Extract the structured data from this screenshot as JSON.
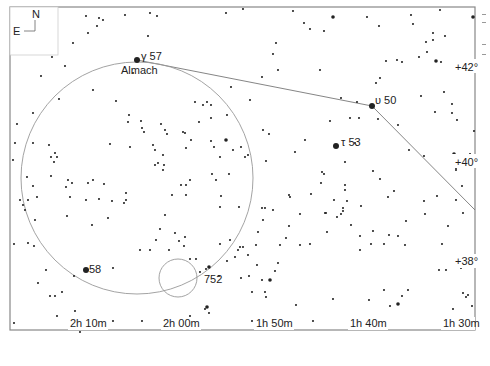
{
  "compass": {
    "north": "N",
    "east": "E"
  },
  "labels": {
    "almach_greek": "γ 57",
    "almach_name": "Almach",
    "upsilon": "υ 50",
    "tau": "τ 53",
    "star58": "58",
    "ngc752": "752"
  },
  "dec_labels": [
    "+42°",
    "+40°",
    "+38°"
  ],
  "ra_labels": [
    "2h 10m",
    "2h 00m",
    "1h 50m",
    "1h 40m",
    "1h 30m"
  ],
  "credit": "Megastar",
  "colors": {
    "frame": "#888888",
    "line": "#777777",
    "star": "#222222",
    "bg": "#ffffff"
  },
  "stars": [
    [
      86,
      16,
      1
    ],
    [
      99,
      18,
      1
    ],
    [
      103,
      20,
      1
    ],
    [
      125,
      15,
      1
    ],
    [
      97,
      26,
      1
    ],
    [
      88,
      33,
      1
    ],
    [
      73,
      43,
      1
    ],
    [
      150,
      13,
      1
    ],
    [
      137,
      60,
      3
    ],
    [
      148,
      36,
      1
    ],
    [
      133,
      73,
      1
    ],
    [
      65,
      66,
      1
    ],
    [
      41,
      76,
      1
    ],
    [
      93,
      90,
      1
    ],
    [
      116,
      101,
      1
    ],
    [
      33,
      113,
      1
    ],
    [
      59,
      99,
      1
    ],
    [
      157,
      16,
      1
    ],
    [
      226,
      13,
      1
    ],
    [
      243,
      9,
      1
    ],
    [
      293,
      11,
      1
    ],
    [
      304,
      23,
      1
    ],
    [
      310,
      29,
      1
    ],
    [
      333,
      17,
      2
    ],
    [
      324,
      31,
      1
    ],
    [
      276,
      43,
      1
    ],
    [
      278,
      70,
      1
    ],
    [
      273,
      54,
      1
    ],
    [
      320,
      70,
      1
    ],
    [
      262,
      77,
      1
    ],
    [
      231,
      87,
      1
    ],
    [
      250,
      100,
      1
    ],
    [
      367,
      17,
      1
    ],
    [
      411,
      15,
      1
    ],
    [
      413,
      24,
      1
    ],
    [
      379,
      26,
      1
    ],
    [
      440,
      10,
      1
    ],
    [
      473,
      17,
      2
    ],
    [
      433,
      33,
      1
    ],
    [
      445,
      36,
      1
    ],
    [
      454,
      61,
      1
    ],
    [
      441,
      62,
      1
    ],
    [
      419,
      57,
      1
    ],
    [
      436,
      61,
      2
    ],
    [
      380,
      78,
      1
    ],
    [
      376,
      83,
      1
    ],
    [
      386,
      61,
      1
    ],
    [
      397,
      60,
      1
    ],
    [
      402,
      62,
      1
    ],
    [
      427,
      52,
      1
    ],
    [
      426,
      42,
      1
    ],
    [
      433,
      40,
      1
    ],
    [
      341,
      98,
      1
    ],
    [
      357,
      102,
      1
    ],
    [
      372,
      106,
      3
    ],
    [
      350,
      118,
      1
    ],
    [
      359,
      118,
      1
    ],
    [
      378,
      119,
      1
    ],
    [
      398,
      125,
      1
    ],
    [
      452,
      113,
      1
    ],
    [
      452,
      104,
      1
    ],
    [
      336,
      146,
      3
    ],
    [
      355,
      143,
      1
    ],
    [
      457,
      120,
      1
    ],
    [
      474,
      131,
      1
    ],
    [
      454,
      154,
      2
    ],
    [
      470,
      154,
      1
    ],
    [
      462,
      186,
      1
    ],
    [
      345,
      162,
      1
    ],
    [
      373,
      171,
      1
    ],
    [
      380,
      179,
      1
    ],
    [
      394,
      191,
      1
    ],
    [
      424,
      156,
      1
    ],
    [
      424,
      201,
      1
    ],
    [
      437,
      196,
      1
    ],
    [
      456,
      200,
      1
    ],
    [
      425,
      214,
      1
    ],
    [
      345,
      190,
      1
    ],
    [
      334,
      200,
      1
    ],
    [
      325,
      213,
      1
    ],
    [
      361,
      206,
      1
    ],
    [
      388,
      197,
      1
    ],
    [
      343,
      208,
      1
    ],
    [
      347,
      201,
      1
    ],
    [
      343,
      211,
      1
    ],
    [
      337,
      217,
      1
    ],
    [
      327,
      232,
      1
    ],
    [
      360,
      236,
      1
    ],
    [
      360,
      250,
      1
    ],
    [
      371,
      244,
      1
    ],
    [
      373,
      231,
      1
    ],
    [
      384,
      244,
      1
    ],
    [
      389,
      235,
      1
    ],
    [
      398,
      236,
      1
    ],
    [
      406,
      221,
      1
    ],
    [
      405,
      245,
      1
    ],
    [
      448,
      226,
      1
    ],
    [
      442,
      244,
      1
    ],
    [
      446,
      270,
      1
    ],
    [
      439,
      270,
      1
    ],
    [
      466,
      297,
      1
    ],
    [
      468,
      295,
      1
    ],
    [
      453,
      309,
      1
    ],
    [
      472,
      306,
      1
    ],
    [
      463,
      293,
      1
    ],
    [
      333,
      299,
      1
    ],
    [
      369,
      300,
      1
    ],
    [
      384,
      290,
      1
    ],
    [
      390,
      306,
      1
    ],
    [
      398,
      304,
      2
    ],
    [
      402,
      296,
      1
    ],
    [
      408,
      290,
      1
    ],
    [
      296,
      305,
      1
    ],
    [
      313,
      321,
      1
    ],
    [
      266,
      297,
      1
    ],
    [
      287,
      328,
      1
    ],
    [
      252,
      321,
      1
    ],
    [
      252,
      292,
      1
    ],
    [
      270,
      280,
      2
    ],
    [
      262,
      280,
      1
    ],
    [
      275,
      271,
      1
    ],
    [
      257,
      265,
      1
    ],
    [
      235,
      257,
      1
    ],
    [
      241,
      278,
      1
    ],
    [
      249,
      276,
      1
    ],
    [
      243,
      247,
      1
    ],
    [
      219,
      276,
      1
    ],
    [
      227,
      261,
      1
    ],
    [
      238,
      250,
      1
    ],
    [
      278,
      263,
      1
    ],
    [
      258,
      232,
      1
    ],
    [
      280,
      245,
      1
    ],
    [
      286,
      238,
      1
    ],
    [
      265,
      208,
      1
    ],
    [
      273,
      210,
      1
    ],
    [
      289,
      226,
      1
    ],
    [
      300,
      214,
      1
    ],
    [
      311,
      194,
      1
    ],
    [
      289,
      195,
      1
    ],
    [
      290,
      197,
      1
    ],
    [
      220,
      157,
      1
    ],
    [
      221,
      196,
      1
    ],
    [
      185,
      237,
      1
    ],
    [
      140,
      250,
      1
    ],
    [
      150,
      250,
      1
    ],
    [
      169,
      250,
      1
    ],
    [
      179,
      241,
      1
    ],
    [
      184,
      246,
      1
    ],
    [
      190,
      259,
      1
    ],
    [
      196,
      259,
      1
    ],
    [
      200,
      272,
      1
    ],
    [
      206,
      269,
      1
    ],
    [
      209,
      267,
      2
    ],
    [
      220,
      244,
      1
    ],
    [
      230,
      240,
      1
    ],
    [
      240,
      247,
      1
    ],
    [
      248,
      255,
      1
    ],
    [
      265,
      292,
      1
    ],
    [
      205,
      309,
      1
    ],
    [
      207,
      307,
      2
    ],
    [
      190,
      316,
      1
    ],
    [
      209,
      313,
      1
    ],
    [
      179,
      322,
      1
    ],
    [
      166,
      323,
      1
    ],
    [
      142,
      321,
      1
    ],
    [
      113,
      321,
      1
    ],
    [
      80,
      332,
      1
    ],
    [
      14,
      244,
      1
    ],
    [
      46,
      270,
      1
    ],
    [
      74,
      276,
      1
    ],
    [
      86,
      270,
      3
    ],
    [
      113,
      268,
      1
    ],
    [
      38,
      283,
      1
    ],
    [
      50,
      296,
      1
    ],
    [
      55,
      296,
      1
    ],
    [
      62,
      292,
      1
    ],
    [
      57,
      316,
      1
    ],
    [
      75,
      311,
      1
    ],
    [
      75,
      319,
      1
    ],
    [
      14,
      323,
      1
    ],
    [
      34,
      246,
      1
    ],
    [
      20,
      200,
      1
    ],
    [
      25,
      210,
      1
    ],
    [
      23,
      205,
      1
    ],
    [
      28,
      243,
      1
    ],
    [
      52,
      57,
      1
    ],
    [
      49,
      145,
      1
    ],
    [
      51,
      157,
      1
    ],
    [
      54,
      162,
      1
    ],
    [
      55,
      153,
      1
    ],
    [
      57,
      157,
      1
    ],
    [
      51,
      176,
      1
    ],
    [
      93,
      180,
      1
    ],
    [
      104,
      184,
      1
    ],
    [
      126,
      193,
      1
    ],
    [
      130,
      147,
      1
    ],
    [
      142,
      128,
      1
    ],
    [
      155,
      150,
      1
    ],
    [
      110,
      144,
      1
    ],
    [
      153,
      145,
      1
    ],
    [
      17,
      124,
      1
    ],
    [
      33,
      143,
      1
    ],
    [
      15,
      143,
      1
    ],
    [
      13,
      160,
      1
    ],
    [
      27,
      177,
      1
    ],
    [
      33,
      186,
      1
    ],
    [
      37,
      197,
      1
    ],
    [
      28,
      200,
      1
    ],
    [
      35,
      220,
      1
    ],
    [
      68,
      180,
      1
    ],
    [
      66,
      187,
      1
    ],
    [
      72,
      183,
      1
    ],
    [
      70,
      197,
      1
    ],
    [
      88,
      183,
      1
    ],
    [
      86,
      200,
      1
    ],
    [
      99,
      199,
      1
    ],
    [
      112,
      201,
      1
    ],
    [
      124,
      203,
      1
    ],
    [
      126,
      200,
      1
    ],
    [
      67,
      216,
      1
    ],
    [
      92,
      225,
      1
    ],
    [
      108,
      218,
      1
    ],
    [
      156,
      240,
      1
    ],
    [
      175,
      233,
      1
    ],
    [
      160,
      229,
      1
    ],
    [
      186,
      185,
      1
    ],
    [
      190,
      180,
      1
    ],
    [
      220,
      207,
      1
    ],
    [
      239,
      207,
      1
    ],
    [
      212,
      174,
      1
    ],
    [
      216,
      180,
      1
    ],
    [
      229,
      174,
      1
    ],
    [
      155,
      165,
      1
    ],
    [
      164,
      165,
      1
    ],
    [
      163,
      155,
      1
    ],
    [
      158,
      163,
      1
    ],
    [
      163,
      170,
      1
    ],
    [
      186,
      148,
      1
    ],
    [
      191,
      140,
      1
    ],
    [
      211,
      118,
      1
    ],
    [
      199,
      122,
      1
    ],
    [
      195,
      102,
      1
    ],
    [
      203,
      105,
      1
    ],
    [
      207,
      102,
      1
    ],
    [
      211,
      105,
      1
    ],
    [
      227,
      115,
      1
    ],
    [
      226,
      140,
      2
    ],
    [
      211,
      141,
      1
    ],
    [
      214,
      147,
      1
    ],
    [
      233,
      150,
      1
    ],
    [
      241,
      147,
      1
    ],
    [
      245,
      157,
      1
    ],
    [
      248,
      155,
      1
    ],
    [
      269,
      134,
      1
    ],
    [
      263,
      130,
      1
    ],
    [
      266,
      161,
      1
    ],
    [
      262,
      208,
      1
    ],
    [
      263,
      220,
      1
    ],
    [
      256,
      245,
      1
    ],
    [
      186,
      195,
      1
    ],
    [
      172,
      195,
      1
    ],
    [
      181,
      185,
      1
    ],
    [
      165,
      215,
      1
    ],
    [
      144,
      132,
      1
    ],
    [
      161,
      124,
      1
    ],
    [
      141,
      121,
      1
    ],
    [
      129,
      115,
      1
    ],
    [
      128,
      122,
      1
    ],
    [
      165,
      130,
      1
    ],
    [
      167,
      134,
      1
    ],
    [
      185,
      133,
      1
    ],
    [
      183,
      132,
      1
    ],
    [
      295,
      152,
      1
    ],
    [
      330,
      121,
      1
    ],
    [
      322,
      172,
      1
    ],
    [
      324,
      174,
      1
    ],
    [
      321,
      183,
      1
    ],
    [
      345,
      185,
      1
    ],
    [
      326,
      213,
      1
    ],
    [
      300,
      245,
      1
    ],
    [
      310,
      244,
      1
    ],
    [
      351,
      225,
      1
    ],
    [
      341,
      214,
      1
    ],
    [
      305,
      140,
      1
    ],
    [
      409,
      150,
      1
    ],
    [
      435,
      112,
      1
    ],
    [
      444,
      92,
      1
    ],
    [
      421,
      96,
      1
    ],
    [
      456,
      168,
      1
    ],
    [
      456,
      170,
      1
    ],
    [
      463,
      213,
      1
    ],
    [
      455,
      258,
      1
    ],
    [
      465,
      258,
      1
    ],
    [
      461,
      268,
      1
    ]
  ]
}
